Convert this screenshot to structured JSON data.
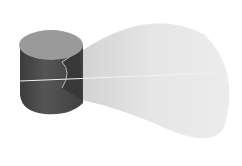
{
  "figure": {
    "colors": {
      "background": "#ffffff",
      "cylinder_top": "#9a9a9a",
      "cylinder_side": "#4a4a4a",
      "cylinder_side_shadow": "#3a3a3a",
      "wedge_face": "#3c3c3c",
      "cone": "#e4e4e4",
      "cone_edge": "#cfcfcf",
      "axis_line": "#f2f2f2"
    }
  }
}
